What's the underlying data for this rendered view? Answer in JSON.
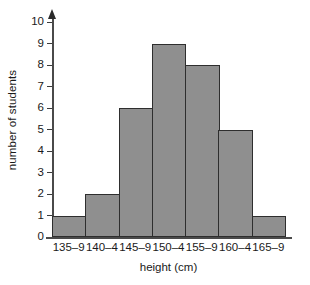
{
  "chart_data": {
    "type": "bar",
    "title": "",
    "subtitle": "",
    "xlabel": "height (cm)",
    "ylabel": "number of students",
    "categories": [
      "135–9",
      "140–4",
      "145–9",
      "150–4",
      "155–9",
      "160–4",
      "165–9"
    ],
    "values": [
      1,
      2,
      6,
      9,
      8,
      5,
      1
    ],
    "ylim": [
      0,
      10
    ],
    "y_ticks": [
      0,
      1,
      2,
      3,
      4,
      5,
      6,
      7,
      8,
      9,
      10
    ],
    "y_tick_labels": [
      "0",
      "1",
      "2",
      "3",
      "4",
      "5",
      "6",
      "7",
      "8",
      "9",
      "10"
    ],
    "grid": false,
    "legend": false,
    "legend_position": "none",
    "bar_fill_color": "#8f8f8f",
    "bar_edge_color": "#2e2e2e",
    "axis_color": "#4a4a4a",
    "background_color": "#ffffff",
    "bars_adjacent": true,
    "y_axis_arrow": true
  }
}
